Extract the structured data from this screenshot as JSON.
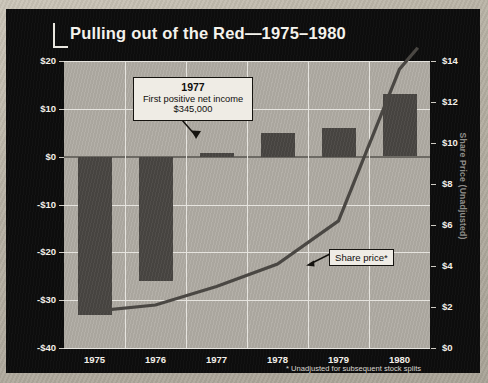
{
  "figure": {
    "title": "Pulling out of the Red—1975–1980",
    "footnote": "* Unadjusted for subsequent  stock splits",
    "colors": {
      "panel_background": "#0d0d0d",
      "plot_background": "#b0aca4",
      "bar_fill": "#4a4743",
      "line_stroke": "#4a4743",
      "gridline": "#e6e4df",
      "zero_axis": "#6d6a64",
      "tick_text": "#f2efe8",
      "right_axis_label": "#8f8d89",
      "callout_background": "#efece5",
      "callout_border": "#15130f"
    }
  },
  "annotations": {
    "net_income_callout": {
      "year": "1977",
      "description": "First positive net income",
      "value": "$345,000"
    },
    "share_price_callout": {
      "label": "Share price*"
    }
  },
  "chart_data": {
    "type": "bar",
    "title": "Pulling out of the Red—1975–1980",
    "subtitle": "",
    "xlabel": "",
    "categories": [
      "1975",
      "1976",
      "1977",
      "1978",
      "1979",
      "1980"
    ],
    "grid": true,
    "legend": "none",
    "series": [
      {
        "name": "Net Income (Millions)",
        "type": "bar",
        "axis": "left",
        "values": [
          -33.0,
          -26.0,
          0.345,
          5.0,
          6.0,
          13.0
        ],
        "unit": "$ millions"
      },
      {
        "name": "Share Price (Unadjusted)",
        "type": "line",
        "axis": "right",
        "values": [
          1.8,
          2.1,
          3.0,
          4.1,
          6.2,
          13.6
        ],
        "unit": "$"
      }
    ],
    "axes": {
      "left": {
        "label": "Net Income (Millions)",
        "ticks": [
          "$20",
          "$10",
          "$0",
          "-$10",
          "-$20",
          "-$30",
          "-$40"
        ],
        "tick_values": [
          20,
          10,
          0,
          -10,
          -20,
          -30,
          -40
        ],
        "ylim": [
          -40,
          20
        ]
      },
      "right": {
        "label": "Share Price (Unadjusted)",
        "ticks": [
          "$14",
          "$12",
          "$10",
          "$8",
          "$6",
          "$4",
          "$2",
          "$0"
        ],
        "tick_values": [
          14,
          12,
          10,
          8,
          6,
          4,
          2,
          0
        ],
        "ylim": [
          0,
          14
        ]
      }
    }
  }
}
